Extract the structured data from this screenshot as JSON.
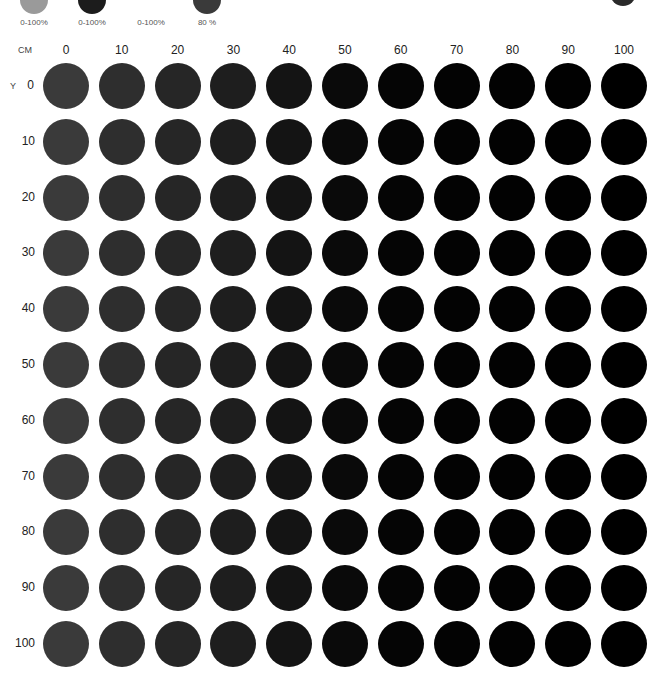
{
  "legend": [
    {
      "label": "0-100%",
      "color": "#9a9a9a",
      "x": 20
    },
    {
      "label": "0-100%",
      "color": "#1c1c1c",
      "x": 78
    },
    {
      "label": "0-100%",
      "color": null,
      "x": 137
    },
    {
      "label": "80 %",
      "color": "#3a3a3a",
      "x": 193
    }
  ],
  "corner_swatch_color": "#2a2a2a",
  "axes": {
    "x_title": "CM",
    "y_title": "Y"
  },
  "chart_data": {
    "type": "heatmap",
    "title": "",
    "xlabel": "CM",
    "ylabel": "Y",
    "x": [
      0,
      10,
      20,
      30,
      40,
      50,
      60,
      70,
      80,
      90,
      100
    ],
    "y": [
      0,
      10,
      20,
      30,
      40,
      50,
      60,
      70,
      80,
      90,
      100
    ],
    "legend": [
      "0-100%",
      "0-100%",
      "0-100%",
      "80 %"
    ],
    "column_colors": [
      "#3a3a3a",
      "#2e2e2e",
      "#262626",
      "#1e1e1e",
      "#141414",
      "#0a0a0a",
      "#050505",
      "#030303",
      "#020202",
      "#010101",
      "#000000"
    ]
  }
}
